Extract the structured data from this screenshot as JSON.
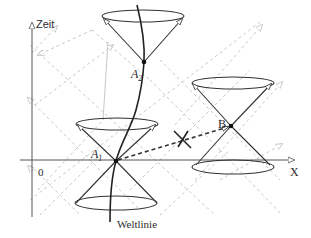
{
  "diagram": {
    "type": "spacetime-light-cones",
    "axes": {
      "time_label": "Zeit",
      "space_label": "X",
      "origin_label": "0"
    },
    "events": {
      "a1": {
        "label": "A",
        "subscript": "1"
      },
      "a2": {
        "label": "A",
        "subscript": "2"
      },
      "b": {
        "label": "B"
      }
    },
    "worldline_label": "Weltlinie",
    "forbidden_mark": "✕",
    "colors": {
      "ink": "#2b2b2b",
      "grid": "#c8c8c8",
      "background": "#ffffff"
    }
  }
}
